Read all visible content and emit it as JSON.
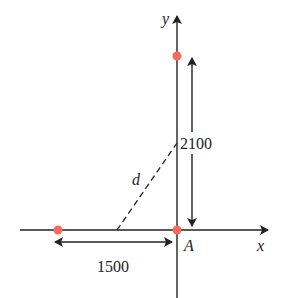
{
  "diagram": {
    "axes": {
      "x_label": "x",
      "y_label": "y"
    },
    "points": [
      {
        "name": "top-point",
        "color": "#f26b5b"
      },
      {
        "name": "left-point",
        "color": "#f26b5b"
      },
      {
        "name": "origin-point-A",
        "color": "#f26b5b"
      }
    ],
    "labels": {
      "origin": "A",
      "distance": "d",
      "vertical_length": "2100",
      "horizontal_length": "1500"
    },
    "colors": {
      "line": "#222222",
      "point": "#f26b5b"
    }
  }
}
